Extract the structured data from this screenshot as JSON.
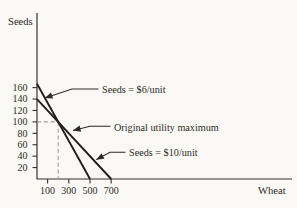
{
  "figure": {
    "background": "#faf9f6",
    "ink_color": "#2d2b25",
    "guide_color": "#a19e96"
  },
  "chart_data": {
    "type": "line",
    "title": "",
    "xlabel": "Wheat",
    "ylabel": "Seeds",
    "x_ticks": [
      100,
      300,
      500,
      700
    ],
    "y_ticks": [
      20,
      40,
      60,
      80,
      100,
      120,
      140,
      160
    ],
    "xlim": [
      0,
      830
    ],
    "ylim": [
      0,
      185
    ],
    "grid": false,
    "series": [
      {
        "name": "Seeds = $6/unit",
        "points": [
          [
            0,
            166.7
          ],
          [
            500,
            0
          ]
        ]
      },
      {
        "name": "Seeds = $10/unit",
        "points": [
          [
            0,
            140
          ],
          [
            700,
            0
          ]
        ]
      }
    ],
    "guides": {
      "x": 200,
      "y": 100
    },
    "annotations": [
      {
        "label": "Seeds = $6/unit",
        "tip": [
          75,
          142
        ]
      },
      {
        "label": "Original utility maximum",
        "tip": [
          340,
          85
        ]
      },
      {
        "label": "Seeds = $10/unit",
        "tip": [
          560,
          34
        ]
      }
    ]
  }
}
